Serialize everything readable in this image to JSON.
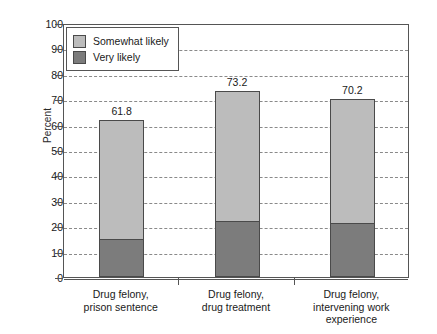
{
  "chart_data": {
    "type": "bar",
    "subtype": "stacked-bar",
    "title": "",
    "xlabel": "",
    "ylabel": "Percent",
    "ylim": [
      0,
      100
    ],
    "ytick_step": 10,
    "yticks": [
      0,
      10,
      20,
      30,
      40,
      50,
      60,
      70,
      80,
      90,
      100
    ],
    "ytick_labels": [
      "0",
      "10",
      "20",
      "30",
      "40",
      "50",
      "60",
      "70",
      "80",
      "90",
      "100"
    ],
    "grid": true,
    "grid_style": "dashed",
    "grid_axis": "y",
    "legend_position": "top-left inside",
    "categories": [
      "Drug felony,\nprison sentence",
      "Drug felony,\ndrug treatment",
      "Drug felony,\nintervening work\nexperience"
    ],
    "category_lines": [
      [
        "Drug felony,",
        "prison sentence"
      ],
      [
        "Drug felony,",
        "drug treatment"
      ],
      [
        "Drug felony,",
        "intervening work",
        "experience"
      ]
    ],
    "series": [
      {
        "name": "Very likely",
        "color": "#7c7c7c",
        "values": [
          14.8,
          22.1,
          21.3
        ]
      },
      {
        "name": "Somewhat likely",
        "color": "#bcbcbc",
        "values": [
          47.0,
          51.1,
          48.9
        ]
      }
    ],
    "totals": [
      61.8,
      73.2,
      70.2
    ],
    "total_labels": [
      "61.8",
      "73.2",
      "70.2"
    ]
  },
  "legend": {
    "items": [
      {
        "label": "Somewhat likely",
        "color": "#bcbcbc"
      },
      {
        "label": "Very likely",
        "color": "#7c7c7c"
      }
    ]
  },
  "axis": {
    "y_title": "Percent"
  },
  "colors": {
    "somewhat_likely": "#bcbcbc",
    "very_likely": "#7c7c7c",
    "frame": "#555555",
    "grid": "#8a8a8a",
    "background": "#ffffff"
  }
}
